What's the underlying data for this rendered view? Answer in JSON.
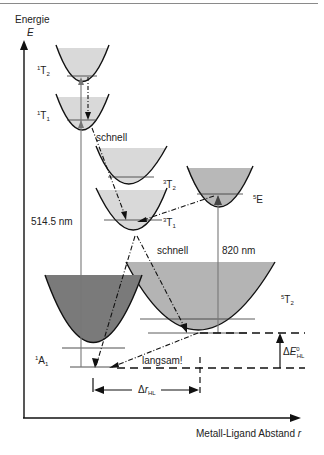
{
  "diagram": {
    "axes": {
      "y_label_line1": "Energie",
      "y_label_line2": "E",
      "x_label": "Metall-Ligand Abstand",
      "x_label_var": "r"
    },
    "states": {
      "1T2": {
        "base": "T",
        "sup": "1",
        "sub": "2"
      },
      "1T1": {
        "base": "T",
        "sup": "1",
        "sub": "1"
      },
      "3T2": {
        "base": "T",
        "sup": "3",
        "sub": "2"
      },
      "3T1": {
        "base": "T",
        "sup": "3",
        "sub": "1"
      },
      "5E": {
        "base": "E",
        "sup": "5",
        "sub": ""
      },
      "5T2": {
        "base": "T",
        "sup": "5",
        "sub": "2"
      },
      "1A1": {
        "base": "A",
        "sup": "1",
        "sub": "1"
      }
    },
    "annotations": {
      "fast1": "schnell",
      "fast2": "schnell",
      "slow": "langsam!",
      "excitation_ls": "514.5 nm",
      "excitation_hs": "820 nm",
      "delta_r": {
        "prefix": "Δ",
        "var": "r",
        "sub": "HL"
      },
      "delta_e": {
        "prefix": "Δ",
        "var": "E",
        "sup": "0",
        "sub": "HL"
      }
    },
    "colors": {
      "light_fill": "#d9d9d9",
      "mid_fill": "#b4b4b4",
      "dark_fill": "#7a7a7a",
      "curve": "#111111",
      "arrow_gray": "#777777"
    }
  }
}
